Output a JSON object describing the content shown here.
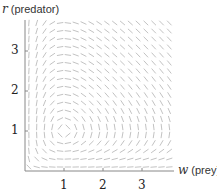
{
  "chart_data": {
    "type": "direction_field",
    "title": "",
    "xlabel": "w (prey)",
    "ylabel": "r (predator)",
    "xlabel_var": "w",
    "xlabel_unit": "(prey)",
    "ylabel_var": "r",
    "ylabel_unit": "(predator)",
    "xticks": [
      1,
      2,
      3
    ],
    "yticks": [
      1,
      2,
      3
    ],
    "xlim": [
      0,
      3.9
    ],
    "ylim": [
      0,
      3.8
    ],
    "grid": false,
    "equilibrium": [
      1,
      1
    ],
    "field": "dw/dt = w(1 - r), dr/dt = r(w - 1)",
    "sample_spacing": 0.2,
    "segment_color": "#bbbbbb",
    "axis_color": "#888888"
  },
  "labels": {
    "ylabel_var": "r",
    "ylabel_unit": "(predator)",
    "xlabel_var": "w",
    "xlabel_unit": "(prey)",
    "xtick_1": "1",
    "xtick_2": "2",
    "xtick_3": "3",
    "ytick_1": "1",
    "ytick_2": "2",
    "ytick_3": "3"
  }
}
